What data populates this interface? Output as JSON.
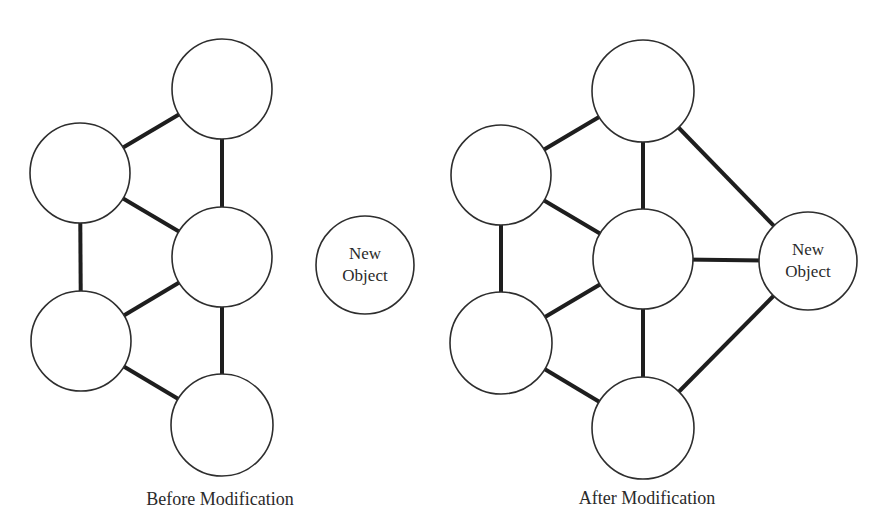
{
  "colors": {
    "background": "#ffffff",
    "node_stroke": "#2e2e2e",
    "node_fill": "#ffffff",
    "edge_stroke": "#1e1e1e",
    "text": "#2a2a2a"
  },
  "before": {
    "caption": "Before Modification",
    "nodes": [
      {
        "id": "b1",
        "cx": 222,
        "cy": 89,
        "r": 50,
        "label": ""
      },
      {
        "id": "b2",
        "cx": 80,
        "cy": 173,
        "r": 50,
        "label": ""
      },
      {
        "id": "b3",
        "cx": 222,
        "cy": 257,
        "r": 50,
        "label": ""
      },
      {
        "id": "b4",
        "cx": 81,
        "cy": 341,
        "r": 50,
        "label": ""
      },
      {
        "id": "b5",
        "cx": 222,
        "cy": 425,
        "r": 51,
        "label": ""
      }
    ],
    "edges": [
      [
        "b1",
        "b2"
      ],
      [
        "b1",
        "b3"
      ],
      [
        "b2",
        "b3"
      ],
      [
        "b2",
        "b4"
      ],
      [
        "b3",
        "b4"
      ],
      [
        "b3",
        "b5"
      ],
      [
        "b4",
        "b5"
      ]
    ]
  },
  "new_object": {
    "line1": "New",
    "line2": "Object",
    "cx": 365,
    "cy": 265,
    "r": 49
  },
  "after": {
    "caption": "After Modification",
    "nodes": [
      {
        "id": "a1",
        "cx": 643,
        "cy": 91,
        "r": 51,
        "label": ""
      },
      {
        "id": "a2",
        "cx": 501,
        "cy": 175,
        "r": 50,
        "label": ""
      },
      {
        "id": "a3",
        "cx": 643,
        "cy": 259,
        "r": 50,
        "label": ""
      },
      {
        "id": "a4",
        "cx": 501,
        "cy": 343,
        "r": 51,
        "label": ""
      },
      {
        "id": "a5",
        "cx": 643,
        "cy": 428,
        "r": 51,
        "label": ""
      },
      {
        "id": "a6",
        "cx": 808,
        "cy": 261,
        "r": 49,
        "label": "New Object"
      }
    ],
    "edges": [
      [
        "a1",
        "a2"
      ],
      [
        "a1",
        "a3"
      ],
      [
        "a2",
        "a3"
      ],
      [
        "a2",
        "a4"
      ],
      [
        "a3",
        "a4"
      ],
      [
        "a3",
        "a5"
      ],
      [
        "a4",
        "a5"
      ],
      [
        "a1",
        "a6"
      ],
      [
        "a3",
        "a6"
      ],
      [
        "a5",
        "a6"
      ]
    ],
    "new_object_label": {
      "line1": "New",
      "line2": "Object"
    }
  }
}
